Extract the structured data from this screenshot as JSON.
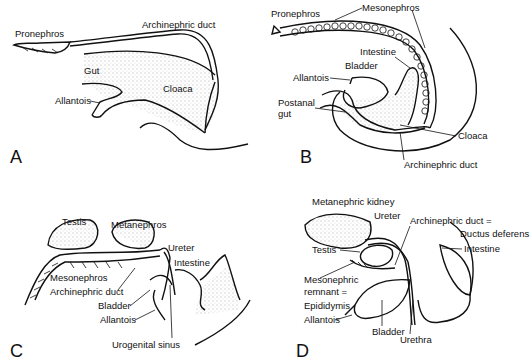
{
  "figure": {
    "panels": [
      {
        "id": "A",
        "letter": "A",
        "labels": {
          "pronephros": "Pronephros",
          "archinephric_duct": "Archinephric duct",
          "gut": "Gut",
          "cloaca": "Cloaca",
          "allantois": "Allantois"
        }
      },
      {
        "id": "B",
        "letter": "B",
        "labels": {
          "pronephros": "Pronephros",
          "mesonephros": "Mesonephros",
          "intestine": "Intestine",
          "bladder": "Bladder",
          "allantois": "Allantois",
          "postanal_gut_1": "Postanal",
          "postanal_gut_2": "gut",
          "cloaca": "Cloaca",
          "archinephric_duct": "Archinephric duct"
        }
      },
      {
        "id": "C",
        "letter": "C",
        "labels": {
          "testis": "Testis",
          "metanephros": "Metanephros",
          "ureter": "Ureter",
          "intestine": "Intestine",
          "mesonephros": "Mesonephros",
          "archinephric_duct": "Archinephric duct",
          "bladder": "Bladder",
          "allantois": "Allantois",
          "urogenital_sinus": "Urogenital sinus"
        }
      },
      {
        "id": "D",
        "letter": "D",
        "labels": {
          "metanephric_kidney": "Metanephric kidney",
          "ureter": "Ureter",
          "archinephric_duct": "Archinephric duct =",
          "ductus_deferens": "Ductus deferens",
          "testis": "Testis",
          "intestine": "Intestine",
          "mesonephric_remnant_1": "Mesonephric",
          "mesonephric_remnant_2": "remnant =",
          "epididymis": "Epididymis",
          "allantois": "Allantois",
          "bladder": "Bladder",
          "urethra": "Urethra"
        }
      }
    ]
  }
}
